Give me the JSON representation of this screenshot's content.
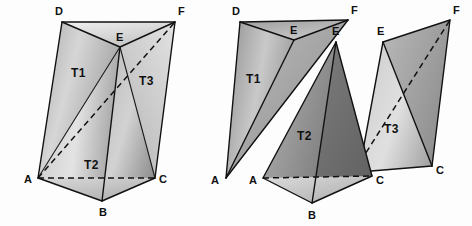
{
  "figure": {
    "background_color": "#fdfdfd",
    "edge_color": "#111111",
    "label_color": "#101010",
    "panels": [
      {
        "name": "assembled-prism",
        "caption": "",
        "vertex_labels": [
          "D",
          "F",
          "E",
          "T1",
          "T3",
          "T2",
          "A",
          "C",
          "B"
        ]
      },
      {
        "name": "exploded-tetrahedra",
        "caption": "",
        "vertex_labels": [
          "D",
          "F",
          "E",
          "E",
          "E",
          "F",
          "T1",
          "T2",
          "T3",
          "A",
          "A",
          "C",
          "C",
          "B"
        ]
      }
    ]
  },
  "left_panel": {
    "name": "assembled-prism",
    "vertices": [
      {
        "id": "D",
        "label": "D",
        "x": 62,
        "y": 22,
        "label_x": 55,
        "label_y": 15
      },
      {
        "id": "F",
        "label": "F",
        "x": 175,
        "y": 22,
        "label_x": 178,
        "label_y": 15
      },
      {
        "id": "E",
        "label": "E",
        "x": 120,
        "y": 47,
        "label_x": 119,
        "label_y": 40
      },
      {
        "id": "A",
        "label": "A",
        "x": 38,
        "y": 178,
        "label_x": 25,
        "label_y": 182
      },
      {
        "id": "C",
        "label": "C",
        "x": 155,
        "y": 178,
        "label_x": 159,
        "label_y": 182
      },
      {
        "id": "B",
        "label": "B",
        "x": 102,
        "y": 201,
        "label_x": 98,
        "label_y": 215
      }
    ],
    "region_labels": [
      {
        "id": "T1",
        "label": "T1",
        "x": 78,
        "y": 72
      },
      {
        "id": "T3",
        "label": "T3",
        "x": 146,
        "y": 80
      },
      {
        "id": "T2",
        "label": "T2",
        "x": 93,
        "y": 165
      }
    ],
    "hidden_edges": [
      {
        "from": "A",
        "to": "C",
        "style": "dashed"
      },
      {
        "from": "A",
        "to": "F",
        "style": "dashed"
      }
    ],
    "solid_edges": [
      {
        "from": "D",
        "to": "F"
      },
      {
        "from": "D",
        "to": "E"
      },
      {
        "from": "E",
        "to": "F"
      },
      {
        "from": "D",
        "to": "A"
      },
      {
        "from": "F",
        "to": "C"
      },
      {
        "from": "E",
        "to": "B"
      },
      {
        "from": "A",
        "to": "B"
      },
      {
        "from": "B",
        "to": "C"
      },
      {
        "from": "A",
        "to": "E"
      },
      {
        "from": "C",
        "to": "E"
      }
    ]
  },
  "right_panel": {
    "name": "exploded-tetrahedra",
    "tetrahedra": [
      {
        "id": "T1",
        "label": "T1",
        "label_x": 253,
        "label_y": 78,
        "vertices": [
          {
            "id": "A",
            "label": "A",
            "x": 226,
            "y": 178,
            "label_x": 212,
            "label_y": 183
          },
          {
            "id": "D",
            "label": "D",
            "x": 240,
            "y": 22,
            "label_x": 233,
            "label_y": 15
          },
          {
            "id": "E",
            "label": "E",
            "x": 294,
            "y": 40,
            "label_x": 290,
            "label_y": 33
          },
          {
            "id": "F",
            "label": "F",
            "x": 348,
            "y": 20,
            "label_x": 351,
            "label_y": 14
          }
        ]
      },
      {
        "id": "T2",
        "label": "T2",
        "label_x": 305,
        "label_y": 135,
        "vertices": [
          {
            "id": "A",
            "label": "A",
            "x": 263,
            "y": 178,
            "label_x": 250,
            "label_y": 183
          },
          {
            "id": "B",
            "label": "B",
            "x": 312,
            "y": 203,
            "label_x": 307,
            "label_y": 218
          },
          {
            "id": "C",
            "label": "C",
            "x": 372,
            "y": 176,
            "label_x": 376,
            "label_y": 182
          },
          {
            "id": "E",
            "label": "E",
            "x": 336,
            "y": 42,
            "label_x": 333,
            "label_y": 34
          }
        ]
      },
      {
        "id": "T3",
        "label": "T3",
        "label_x": 392,
        "label_y": 128,
        "vertices": [
          {
            "id": "C",
            "label": "C",
            "x": 359,
            "y": 172,
            "label_x": 361,
            "label_y": 186
          },
          {
            "id": "E",
            "label": "E",
            "x": 383,
            "y": 42,
            "label_x": 377,
            "label_y": 35
          },
          {
            "id": "F",
            "label": "F",
            "x": 450,
            "y": 20,
            "label_x": 453,
            "label_y": 14
          },
          {
            "id": "C2",
            "label": "C",
            "x": 432,
            "y": 166,
            "label_x": 436,
            "label_y": 173
          }
        ]
      }
    ],
    "hidden_edges": [
      {
        "from": "A",
        "to": "C",
        "style": "dashed",
        "tetra": "T2"
      },
      {
        "from": "C",
        "to": "F",
        "style": "dashed",
        "tetra": "T3"
      }
    ]
  },
  "shading": {
    "light_gray": "#d8d8d8",
    "mid_gray": "#b4b4b4",
    "dark_gray": "#8a8a8a",
    "darker_gray": "#6e6e6e",
    "highlight": "#e8e8e8"
  }
}
